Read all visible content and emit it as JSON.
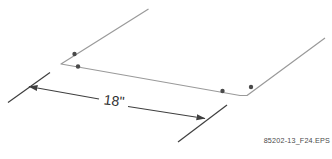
{
  "colors": {
    "background": "#ffffff",
    "wire": "#9a9a9a",
    "dot": "#4a4a4a",
    "dimension": "#3f3f3f",
    "label_text": "#2e2e2e",
    "caption_text": "#4a4a4a"
  },
  "diagram": {
    "wire": {
      "points": [
        [
          148.5,
          9
        ],
        [
          61,
          64
        ],
        [
          240,
          95.5
        ],
        [
          247,
          95.5
        ],
        [
          325,
          38
        ]
      ],
      "stroke_width": 1.2
    },
    "clips": {
      "dots": [
        [
          74.5,
          54
        ],
        [
          78,
          66.5
        ],
        [
          222.5,
          91
        ],
        [
          251,
          87
        ]
      ],
      "radius": 2.2
    },
    "dimension": {
      "label": "18\"",
      "label_center": [
        114,
        101
      ],
      "label_baseline_y": 105.5,
      "label_rotation_deg": 7,
      "extension_lines": [
        [
          [
            8,
            102.5
          ],
          [
            50,
            72.5
          ]
        ],
        [
          [
            178,
            142
          ],
          [
            227,
            105
          ]
        ]
      ],
      "arrow_segments": [
        {
          "from": [
            29,
            86.5
          ],
          "to": [
            99,
            99
          ],
          "arrow": "start"
        },
        {
          "from": [
            128,
            106.5
          ],
          "to": [
            205,
            118.5
          ],
          "arrow": "end"
        }
      ],
      "stroke_width": 1.1
    }
  },
  "caption": {
    "text": "85202-13_F24.EPS"
  }
}
